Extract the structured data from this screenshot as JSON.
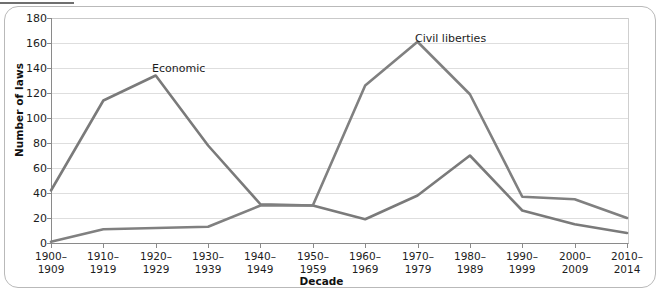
{
  "chart_data": {
    "type": "line",
    "title": "",
    "xlabel": "Decade",
    "ylabel": "Number of laws",
    "categories": [
      "1900–\n1909",
      "1910–\n1919",
      "1920–\n1929",
      "1930–\n1939",
      "1940–\n1949",
      "1950–\n1959",
      "1960–\n1969",
      "1970–\n1979",
      "1980–\n1989",
      "1990–\n1999",
      "2000–\n2009",
      "2010–\n2014"
    ],
    "category_lines": [
      [
        "1900–",
        "1909"
      ],
      [
        "1910–",
        "1919"
      ],
      [
        "1920–",
        "1929"
      ],
      [
        "1930–",
        "1939"
      ],
      [
        "1940–",
        "1949"
      ],
      [
        "1950–",
        "1959"
      ],
      [
        "1960–",
        "1969"
      ],
      [
        "1970–",
        "1979"
      ],
      [
        "1980–",
        "1989"
      ],
      [
        "1990–",
        "1999"
      ],
      [
        "2000–",
        "2009"
      ],
      [
        "2010–",
        "2014"
      ]
    ],
    "ylim": [
      0,
      180
    ],
    "yticks": [
      0,
      20,
      40,
      60,
      80,
      100,
      120,
      140,
      160,
      180
    ],
    "grid": true,
    "legend": "inline-annotations",
    "series": [
      {
        "name": "Economic",
        "color": "#7a7a7a",
        "values": [
          42,
          114,
          134,
          78,
          31,
          30,
          19,
          38,
          70,
          26,
          15,
          8
        ]
      },
      {
        "name": "Civil liberties",
        "color": "#808080",
        "values": [
          1,
          11,
          12,
          13,
          30,
          30,
          126,
          161,
          119,
          37,
          35,
          20
        ]
      }
    ],
    "annotations": [
      {
        "text": "Economic",
        "series": "Economic",
        "x_px": 152,
        "y_px": 62
      },
      {
        "text": "Civil liberties",
        "series": "Civil liberties",
        "x_px": 415,
        "y_px": 32
      }
    ]
  },
  "axes": {
    "y_title": "Number of laws",
    "x_title": "Decade"
  }
}
